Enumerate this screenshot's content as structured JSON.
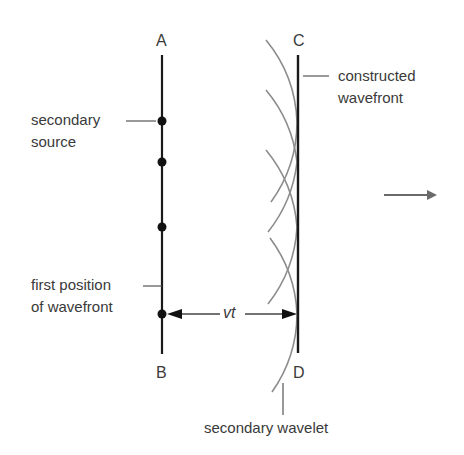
{
  "diagram": {
    "points": {
      "A": "A",
      "B": "B",
      "C": "C",
      "D": "D"
    },
    "labels": {
      "secondary_source_line1": "secondary",
      "secondary_source_line2": "source",
      "first_position_line1": "first position",
      "first_position_line2": "of wavefront",
      "constructed_line1": "constructed",
      "constructed_line2": "wavefront",
      "secondary_wavelet": "secondary wavelet",
      "distance": "vt"
    },
    "direction_arrow": "propagation-direction",
    "secondary_source_count": 4,
    "colors": {
      "wavefront_line": "#1a1a1a",
      "wavelet_arc": "#8c8c8c",
      "text": "#3a3a3a",
      "arrow": "#666666"
    }
  }
}
